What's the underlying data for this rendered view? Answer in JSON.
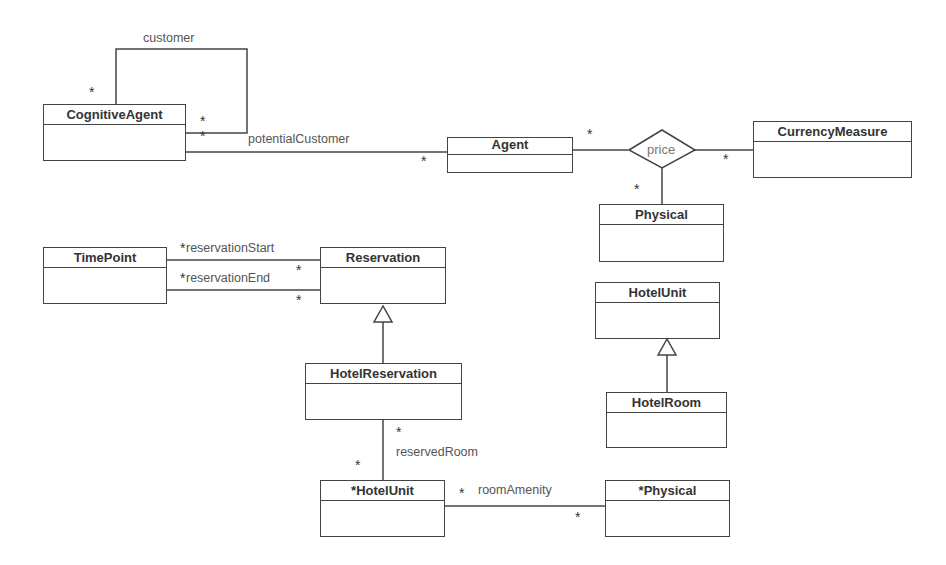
{
  "classes": {
    "cognitive_agent": "CognitiveAgent",
    "agent": "Agent",
    "currency_measure": "CurrencyMeasure",
    "physical": "Physical",
    "time_point": "TimePoint",
    "reservation": "Reservation",
    "hotel_unit": "HotelUnit",
    "hotel_reservation": "HotelReservation",
    "hotel_room": "HotelRoom",
    "hotel_unit_star": "*HotelUnit",
    "physical_star": "*Physical"
  },
  "associations": {
    "customer": "customer",
    "potential_customer": "potentialCustomer",
    "price": "price",
    "reservation_start": "reservationStart",
    "reservation_end": "reservationEnd",
    "reserved_room": "reservedRoom",
    "room_amenity": "roomAmenity"
  },
  "multiplicity": "*",
  "colors": {
    "line": "#444444",
    "text": "#333333",
    "label": "#555555"
  }
}
